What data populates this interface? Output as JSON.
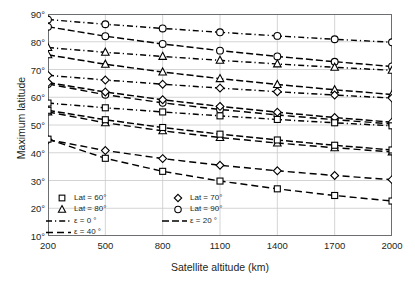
{
  "chart_data": {
    "type": "line",
    "title": "",
    "xlabel": "Satellite altitude (km)",
    "ylabel": "Maximum latitude",
    "xlim": [
      200,
      2000
    ],
    "ylim": [
      10,
      90
    ],
    "xticks": [
      200,
      500,
      800,
      1100,
      1400,
      1700,
      2000
    ],
    "xticklabels": [
      "200",
      "500",
      "800",
      "1100",
      "1400",
      "1700",
      "2000"
    ],
    "yticks": [
      10,
      20,
      30,
      40,
      50,
      60,
      70,
      80,
      90
    ],
    "yticklabels": [
      "10°",
      "20°",
      "30°",
      "40°",
      "50°",
      "60°",
      "70°",
      "80°",
      "90°"
    ],
    "grid": true,
    "grid_color": "#c9c9c9",
    "line_color": "#000000",
    "legend_position": "bottom-left-inside",
    "x": [
      200,
      500,
      800,
      1100,
      1400,
      1700,
      2000
    ],
    "series": [
      {
        "name": "Lat = 90°, ε = 0°",
        "marker": "circle",
        "dash": "long-dot",
        "lat": 90,
        "elev": 0,
        "values": [
          88.0,
          86.3,
          84.8,
          83.4,
          82.1,
          80.9,
          79.8
        ]
      },
      {
        "name": "Lat = 90°, ε = 20°",
        "marker": "circle",
        "dash": "solid",
        "lat": 90,
        "elev": 20,
        "values": [
          85.4,
          82.0,
          79.2,
          76.8,
          74.7,
          72.8,
          71.1
        ]
      },
      {
        "name": "Lat = 90°, ε = 40°",
        "marker": "circle",
        "dash": "dash",
        "lat": 90,
        "elev": 40,
        "values": [
          64.8,
          60.9,
          58.0,
          55.6,
          53.6,
          51.9,
          50.4
        ]
      },
      {
        "name": "Lat = 80°, ε = 0°",
        "marker": "triangle",
        "dash": "long-dot",
        "lat": 80,
        "elev": 0,
        "values": [
          77.9,
          76.2,
          74.7,
          73.3,
          72.0,
          70.8,
          69.7
        ]
      },
      {
        "name": "Lat = 80°, ε = 20°",
        "marker": "triangle",
        "dash": "solid",
        "lat": 80,
        "elev": 20,
        "values": [
          75.3,
          71.9,
          69.1,
          66.7,
          64.6,
          62.7,
          61.0
        ]
      },
      {
        "name": "Lat = 80°, ε = 40°",
        "marker": "triangle",
        "dash": "dash",
        "lat": 80,
        "elev": 40,
        "values": [
          54.7,
          50.8,
          47.9,
          45.5,
          43.5,
          41.8,
          40.3
        ]
      },
      {
        "name": "Lat = 70°, ε = 0°",
        "marker": "diamond",
        "dash": "long-dot",
        "lat": 70,
        "elev": 0,
        "values": [
          67.9,
          66.2,
          64.7,
          63.3,
          62.0,
          60.8,
          59.7
        ]
      },
      {
        "name": "Lat = 70°, ε = 20°",
        "marker": "diamond",
        "dash": "solid",
        "lat": 70,
        "elev": 20,
        "values": [
          65.3,
          61.9,
          59.1,
          56.7,
          54.6,
          52.7,
          51.0
        ]
      },
      {
        "name": "Lat = 70°, ε = 40°",
        "marker": "diamond",
        "dash": "dash",
        "lat": 70,
        "elev": 40,
        "values": [
          44.7,
          40.8,
          37.9,
          35.5,
          33.5,
          31.8,
          30.3
        ]
      },
      {
        "name": "Lat = 60°, ε = 0°",
        "marker": "square",
        "dash": "long-dot",
        "lat": 60,
        "elev": 0,
        "values": [
          57.9,
          56.2,
          54.7,
          53.3,
          52.0,
          50.8,
          49.7
        ]
      },
      {
        "name": "Lat = 60°, ε = 20°",
        "marker": "square",
        "dash": "solid",
        "lat": 60,
        "elev": 20,
        "values": [
          55.3,
          51.9,
          49.1,
          46.7,
          44.6,
          42.7,
          41.0
        ]
      },
      {
        "name": "Lat = 60°, ε = 40°",
        "marker": "square",
        "dash": "dash",
        "lat": 60,
        "elev": 40,
        "values": [
          44.9,
          38.0,
          33.3,
          29.8,
          27.0,
          24.6,
          22.6
        ]
      }
    ],
    "legend": {
      "markers": [
        {
          "label": "Lat = 60°",
          "marker": "square"
        },
        {
          "label": "Lat = 70°",
          "marker": "diamond"
        },
        {
          "label": "Lat = 80°",
          "marker": "triangle"
        },
        {
          "label": "Lat = 90°",
          "marker": "circle"
        }
      ],
      "lines": [
        {
          "label": "ε = 0 °",
          "dash": "long-dot"
        },
        {
          "label": "ε = 20 °",
          "dash": "solid"
        },
        {
          "label": "ε = 40 °",
          "dash": "dash"
        }
      ]
    }
  }
}
